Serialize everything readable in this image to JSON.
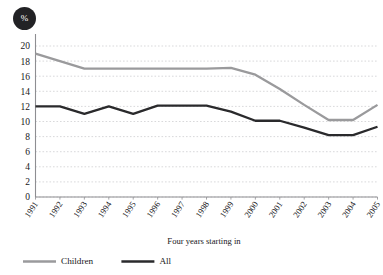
{
  "chart_data": {
    "type": "line",
    "title": "",
    "xlabel": "Four years starting in",
    "ylabel": "%",
    "unit_badge": "%",
    "categories": [
      "1991",
      "1992",
      "1993",
      "1994",
      "1995",
      "1996",
      "1997",
      "1998",
      "1999",
      "2000",
      "2001",
      "2002",
      "2003",
      "2004",
      "2005"
    ],
    "series": [
      {
        "name": "Children",
        "color": "#9a9a9c",
        "values": [
          19.0,
          18.0,
          17.0,
          17.0,
          17.0,
          17.0,
          17.0,
          17.0,
          17.1,
          16.2,
          14.3,
          12.2,
          10.2,
          10.2,
          12.2
        ]
      },
      {
        "name": "All",
        "color": "#2a2a2c",
        "values": [
          12.0,
          12.0,
          11.0,
          12.0,
          11.0,
          12.1,
          12.1,
          12.1,
          11.3,
          10.1,
          10.1,
          9.2,
          8.2,
          8.2,
          9.3
        ]
      }
    ],
    "ylim": [
      0,
      20
    ],
    "yticks": [
      0,
      2,
      4,
      6,
      8,
      10,
      12,
      14,
      16,
      18,
      20
    ],
    "grid": true,
    "legend_position": "bottom"
  },
  "legend": {
    "items": [
      {
        "label": "Children",
        "color": "#9a9a9c"
      },
      {
        "label": "All",
        "color": "#2a2a2c"
      }
    ]
  }
}
